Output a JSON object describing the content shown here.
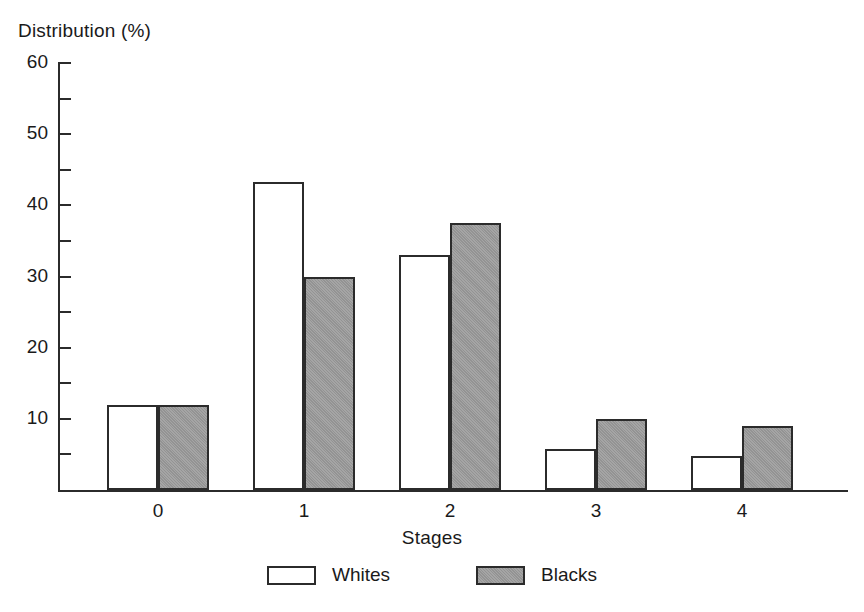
{
  "chart_data": {
    "type": "bar",
    "title": "",
    "xlabel": "Stages",
    "ylabel": "Distribution (%)",
    "categories": [
      "0",
      "1",
      "2",
      "3",
      "4"
    ],
    "series": [
      {
        "name": "Whites",
        "color": "#ffffff",
        "values": [
          12.0,
          43.3,
          33.0,
          5.8,
          4.8
        ]
      },
      {
        "name": "Blacks",
        "color": "#9b9b9b",
        "values": [
          12.0,
          30.0,
          37.5,
          10.0,
          9.0
        ]
      }
    ],
    "ylim": [
      0,
      60
    ],
    "y_major_ticks": [
      60,
      50,
      40,
      30,
      20,
      10
    ],
    "y_minor_ticks": [
      55,
      45,
      35,
      25,
      15,
      5
    ],
    "y_tick_labels": [
      "60",
      "50",
      "40",
      "30",
      "20",
      "10"
    ],
    "grid": false,
    "legend_position": "bottom-center",
    "legend_entries": [
      "Whites",
      "Blacks"
    ],
    "outline_color": "#2b2b2b"
  },
  "axes": {
    "y_title": "Distribution (%)",
    "x_title": "Stages"
  }
}
